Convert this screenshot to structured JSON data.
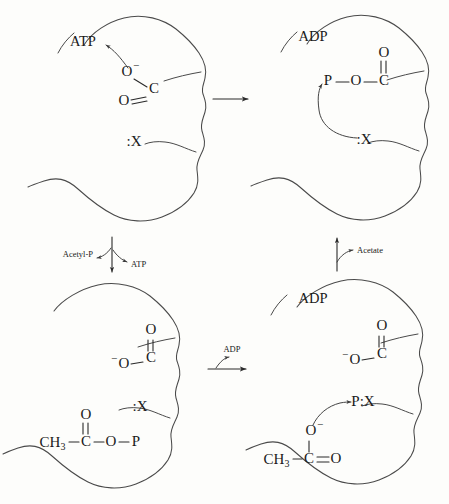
{
  "figure": {
    "background_color": "#fdfdfb",
    "ink_color": "#2a2a2a",
    "outline_color": "#4a4a4a"
  },
  "panels": [
    {
      "id": "top-left",
      "position": "top-left",
      "nucleotide_label": "ATP",
      "active_site_residue": "X",
      "residue_label": ":X",
      "substrate_atoms": [
        {
          "symbol": "O",
          "charge": "−",
          "label": "O−"
        },
        {
          "symbol": "C",
          "charge": "",
          "label": "C"
        },
        {
          "symbol": "O",
          "charge": "",
          "label": "O"
        }
      ],
      "curved_arrow_from": "O−",
      "curved_arrow_to": "ATP"
    },
    {
      "id": "top-right",
      "position": "top-right",
      "nucleotide_label": "ADP",
      "active_site_residue": "X",
      "residue_label": ":X",
      "substrate_atoms": [
        {
          "symbol": "P",
          "charge": "",
          "label": "P"
        },
        {
          "symbol": "O",
          "charge": "",
          "label": "O"
        },
        {
          "symbol": "C",
          "charge": "",
          "label": "C"
        },
        {
          "symbol": "O",
          "charge": "",
          "label": "O"
        }
      ],
      "curved_arrow_from": ":X",
      "curved_arrow_to": "P"
    },
    {
      "id": "bottom-left",
      "position": "bottom-left",
      "nucleotide_label": "",
      "active_site_residue": "X",
      "residue_label": ":X",
      "substrate_atoms": [
        {
          "symbol": "O",
          "charge": "",
          "label": "O"
        },
        {
          "symbol": "C",
          "charge": "",
          "label": "C"
        },
        {
          "symbol": "O",
          "charge": "−",
          "label": "−O"
        }
      ],
      "product_formula": [
        "CH",
        "3",
        "C",
        "O",
        "P"
      ],
      "product_label": "CH3—C(=O)—O—P",
      "methyl_symbol": "CH",
      "methyl_subscript": "3"
    },
    {
      "id": "bottom-right",
      "position": "bottom-right",
      "nucleotide_label": "ADP",
      "active_site_residue": "X",
      "residue_label": "P:X",
      "substrate_atoms": [
        {
          "symbol": "O",
          "charge": "",
          "label": "O"
        },
        {
          "symbol": "C",
          "charge": "",
          "label": "C"
        },
        {
          "symbol": "O",
          "charge": "−",
          "label": "−O"
        }
      ],
      "product_formula": [
        "CH",
        "3",
        "C",
        "O"
      ],
      "product_label": "CH3—C=O",
      "methyl_symbol": "CH",
      "methyl_subscript": "3",
      "acetate_charge_atom": "O",
      "acetate_charge": "−",
      "curved_arrow_from": "O−",
      "curved_arrow_to": "P:X"
    }
  ],
  "reaction_arrows": [
    {
      "id": "top-horizontal",
      "direction": "right",
      "label": "",
      "in_label": "",
      "out_label": ""
    },
    {
      "id": "right-vertical",
      "direction": "up",
      "label": "Acetate",
      "in_label": "Acetate",
      "out_label": ""
    },
    {
      "id": "bottom-horizontal",
      "direction": "right",
      "label": "ADP",
      "in_label": "ADP",
      "out_label": ""
    },
    {
      "id": "left-vertical",
      "direction": "down",
      "label": "",
      "in_label": "Acetyl-P",
      "out_label": "ATP"
    }
  ],
  "text_atoms": {
    "O": "O",
    "C": "C",
    "P": "P",
    "X": ":X",
    "PX": "P:X",
    "minus": "−",
    "CH": "CH",
    "three": "3"
  }
}
